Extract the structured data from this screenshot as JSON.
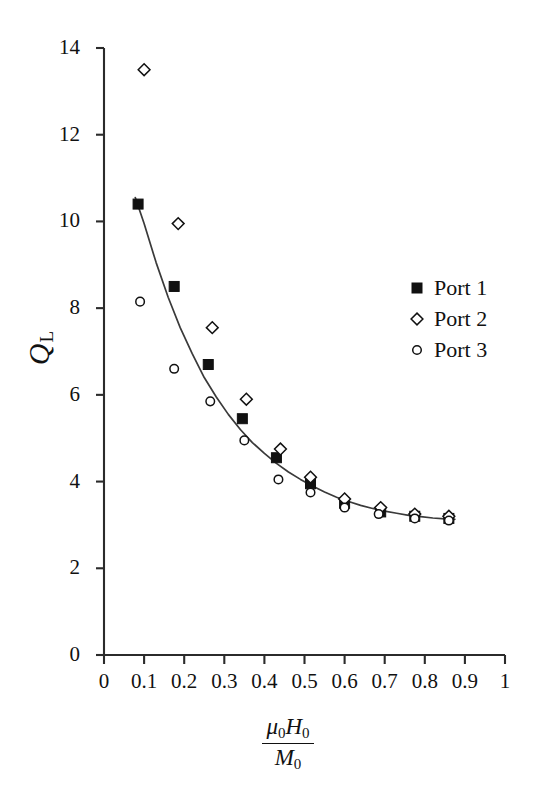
{
  "chart_data": {
    "type": "scatter",
    "title": "",
    "xlabel": "mu_0 H_0 / M_0",
    "xlabel_parts": {
      "numerator_symbol_1": "μ",
      "numerator_sub_1": "0",
      "numerator_symbol_2": "H",
      "numerator_sub_2": "0",
      "denominator_symbol": "M",
      "denominator_sub": "0"
    },
    "ylabel": "Q_L",
    "ylabel_parts": {
      "symbol": "Q",
      "subscript": "L"
    },
    "xlim": [
      0,
      1
    ],
    "ylim": [
      0,
      14
    ],
    "xticks": [
      0,
      0.1,
      0.2,
      0.3,
      0.4,
      0.5,
      0.6,
      0.7,
      0.8,
      0.9,
      1
    ],
    "xticklabels": [
      "0",
      "0.1",
      "0.2",
      "0.3",
      "0.4",
      "0.5",
      "0.6",
      "0.7",
      "0.8",
      "0.9",
      "1"
    ],
    "yticks": [
      0,
      2,
      4,
      6,
      8,
      10,
      12,
      14
    ],
    "yticklabels": [
      "0",
      "2",
      "4",
      "6",
      "8",
      "10",
      "12",
      "14"
    ],
    "grid": false,
    "legend_position": "right",
    "series": [
      {
        "name": "Port 1",
        "marker": "filled-square",
        "color": "#111111",
        "points": [
          {
            "x": 0.085,
            "y": 10.4
          },
          {
            "x": 0.175,
            "y": 8.5
          },
          {
            "x": 0.26,
            "y": 6.7
          },
          {
            "x": 0.345,
            "y": 5.45
          },
          {
            "x": 0.43,
            "y": 4.55
          },
          {
            "x": 0.515,
            "y": 3.95
          },
          {
            "x": 0.6,
            "y": 3.5
          },
          {
            "x": 0.69,
            "y": 3.3
          },
          {
            "x": 0.775,
            "y": 3.2
          },
          {
            "x": 0.86,
            "y": 3.15
          }
        ]
      },
      {
        "name": "Port 2",
        "marker": "open-diamond",
        "color": "#111111",
        "points": [
          {
            "x": 0.1,
            "y": 13.5
          },
          {
            "x": 0.185,
            "y": 9.95
          },
          {
            "x": 0.27,
            "y": 7.55
          },
          {
            "x": 0.355,
            "y": 5.9
          },
          {
            "x": 0.44,
            "y": 4.75
          },
          {
            "x": 0.515,
            "y": 4.1
          },
          {
            "x": 0.6,
            "y": 3.6
          },
          {
            "x": 0.69,
            "y": 3.4
          },
          {
            "x": 0.775,
            "y": 3.25
          },
          {
            "x": 0.86,
            "y": 3.2
          }
        ]
      },
      {
        "name": "Port 3",
        "marker": "open-circle",
        "color": "#111111",
        "points": [
          {
            "x": 0.09,
            "y": 8.15
          },
          {
            "x": 0.175,
            "y": 6.6
          },
          {
            "x": 0.265,
            "y": 5.85
          },
          {
            "x": 0.35,
            "y": 4.95
          },
          {
            "x": 0.435,
            "y": 4.05
          },
          {
            "x": 0.515,
            "y": 3.75
          },
          {
            "x": 0.6,
            "y": 3.4
          },
          {
            "x": 0.685,
            "y": 3.25
          },
          {
            "x": 0.775,
            "y": 3.15
          },
          {
            "x": 0.86,
            "y": 3.1
          }
        ]
      }
    ],
    "fit_curve": {
      "name": "fit",
      "color": "#3a3a3a",
      "points": [
        {
          "x": 0.078,
          "y": 10.55
        },
        {
          "x": 0.1,
          "y": 9.95
        },
        {
          "x": 0.13,
          "y": 9.05
        },
        {
          "x": 0.16,
          "y": 8.25
        },
        {
          "x": 0.19,
          "y": 7.55
        },
        {
          "x": 0.22,
          "y": 6.95
        },
        {
          "x": 0.25,
          "y": 6.4
        },
        {
          "x": 0.28,
          "y": 5.95
        },
        {
          "x": 0.31,
          "y": 5.55
        },
        {
          "x": 0.34,
          "y": 5.2
        },
        {
          "x": 0.37,
          "y": 4.9
        },
        {
          "x": 0.4,
          "y": 4.65
        },
        {
          "x": 0.43,
          "y": 4.42
        },
        {
          "x": 0.46,
          "y": 4.22
        },
        {
          "x": 0.49,
          "y": 4.05
        },
        {
          "x": 0.52,
          "y": 3.9
        },
        {
          "x": 0.55,
          "y": 3.76
        },
        {
          "x": 0.58,
          "y": 3.64
        },
        {
          "x": 0.61,
          "y": 3.54
        },
        {
          "x": 0.64,
          "y": 3.45
        },
        {
          "x": 0.67,
          "y": 3.38
        },
        {
          "x": 0.7,
          "y": 3.32
        },
        {
          "x": 0.73,
          "y": 3.27
        },
        {
          "x": 0.76,
          "y": 3.22
        },
        {
          "x": 0.79,
          "y": 3.19
        },
        {
          "x": 0.82,
          "y": 3.16
        },
        {
          "x": 0.85,
          "y": 3.14
        },
        {
          "x": 0.875,
          "y": 3.13
        }
      ]
    }
  },
  "legend": {
    "items": [
      {
        "label": "Port 1",
        "marker": "filled-square"
      },
      {
        "label": "Port 2",
        "marker": "open-diamond"
      },
      {
        "label": "Port 3",
        "marker": "open-circle"
      }
    ]
  }
}
